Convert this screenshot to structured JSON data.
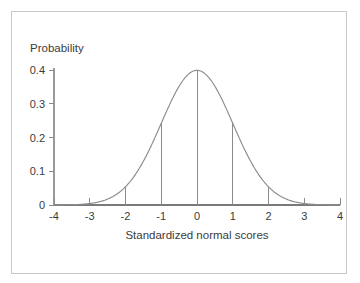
{
  "figure": {
    "background_color": "#ffffff",
    "border_color": "#c8c8c8",
    "curve_color": "#8c8c8c",
    "axis_color": "#7a7a7a",
    "text_color": "#3b3b3b"
  },
  "chart_data": {
    "type": "line",
    "title": "",
    "subtitle": "",
    "xlabel": "Standardized normal scores",
    "ylabel": "Probability",
    "xlim": [
      -4,
      4
    ],
    "ylim": [
      0,
      0.4
    ],
    "grid": false,
    "legend": "none",
    "x_ticks": [
      "-4",
      "-3",
      "-2",
      "-1",
      "0",
      "1",
      "2",
      "3",
      "4"
    ],
    "x_tick_values": [
      -4,
      -3,
      -2,
      -1,
      0,
      1,
      2,
      3,
      4
    ],
    "y_ticks": [
      "0",
      "0.1",
      "0.2",
      "0.3",
      "0.4"
    ],
    "y_tick_values": [
      0,
      0.1,
      0.2,
      0.3,
      0.4
    ],
    "series": [
      {
        "name": "Standard normal density",
        "x": [
          -4,
          -3.8,
          -3.6,
          -3.4,
          -3.2,
          -3,
          -2.8,
          -2.6,
          -2.4,
          -2.2,
          -2,
          -1.8,
          -1.6,
          -1.4,
          -1.2,
          -1,
          -0.8,
          -0.6,
          -0.4,
          -0.2,
          0,
          0.2,
          0.4,
          0.6,
          0.8,
          1,
          1.2,
          1.4,
          1.6,
          1.8,
          2,
          2.2,
          2.4,
          2.6,
          2.8,
          3,
          3.2,
          3.4,
          3.6,
          3.8,
          4
        ],
        "values": [
          0.0001,
          0.0003,
          0.0006,
          0.0012,
          0.0024,
          0.0044,
          0.0079,
          0.0136,
          0.0224,
          0.0355,
          0.054,
          0.079,
          0.1109,
          0.1497,
          0.1942,
          0.242,
          0.2897,
          0.3332,
          0.3683,
          0.391,
          0.3989,
          0.391,
          0.3683,
          0.3332,
          0.2897,
          0.242,
          0.1942,
          0.1497,
          0.1109,
          0.079,
          0.054,
          0.0355,
          0.0224,
          0.0136,
          0.0079,
          0.0044,
          0.0024,
          0.0012,
          0.0006,
          0.0003,
          0.0001
        ]
      }
    ],
    "annotations": [
      {
        "name": "drop-line",
        "x": -2,
        "y": 0.054
      },
      {
        "name": "drop-line",
        "x": -1,
        "y": 0.242
      },
      {
        "name": "drop-line",
        "x": 0,
        "y": 0.3989
      },
      {
        "name": "drop-line",
        "x": 1,
        "y": 0.242
      },
      {
        "name": "drop-line",
        "x": 2,
        "y": 0.054
      }
    ]
  }
}
